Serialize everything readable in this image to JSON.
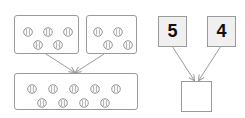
{
  "left_diagram": {
    "group_a": {
      "count": 5
    },
    "group_b": {
      "count": 4
    },
    "total_group": {
      "count": 9
    }
  },
  "right_diagram": {
    "addend_1": "5",
    "addend_2": "4",
    "answer": ""
  },
  "colors": {
    "border": "#9a9a9a",
    "number_box_fill": "#f0f0f0",
    "arrow": "#9a9a9a"
  }
}
